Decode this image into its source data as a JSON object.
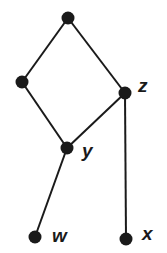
{
  "diagram": {
    "type": "hasse-diagram",
    "nodes": [
      {
        "id": "top",
        "label": "",
        "x": 68,
        "y": 18
      },
      {
        "id": "left",
        "label": "",
        "x": 22,
        "y": 82
      },
      {
        "id": "z",
        "label": "z",
        "x": 125,
        "y": 93,
        "label_x": 138,
        "label_y": 92
      },
      {
        "id": "y",
        "label": "y",
        "x": 67,
        "y": 148,
        "label_x": 82,
        "label_y": 157
      },
      {
        "id": "w",
        "label": "w",
        "x": 35,
        "y": 237,
        "label_x": 52,
        "label_y": 242
      },
      {
        "id": "x",
        "label": "x",
        "x": 126,
        "y": 239,
        "label_x": 142,
        "label_y": 240
      }
    ],
    "edges": [
      [
        "top",
        "left"
      ],
      [
        "top",
        "z"
      ],
      [
        "left",
        "y"
      ],
      [
        "z",
        "y"
      ],
      [
        "y",
        "w"
      ],
      [
        "z",
        "x"
      ]
    ],
    "colors": {
      "node": "#1a1a1a",
      "edge": "#1a1a1a",
      "background": "#ffffff"
    }
  }
}
